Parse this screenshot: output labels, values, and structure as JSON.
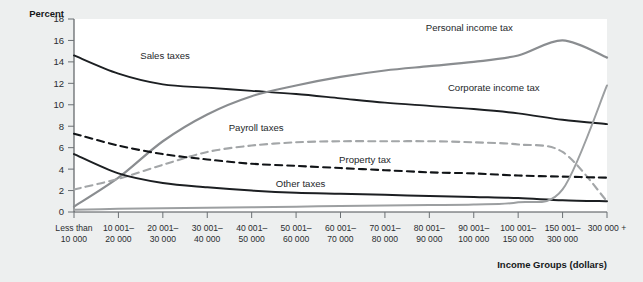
{
  "chart_data": {
    "type": "line",
    "title": "",
    "ylabel": "Percent",
    "xlabel": "Income Groups (dollars)",
    "ylim": [
      0,
      18
    ],
    "ytick_labels": [
      "0",
      "2",
      "4",
      "6",
      "8",
      "10",
      "12",
      "14",
      "16",
      "18"
    ],
    "ytick_values": [
      0,
      2,
      4,
      6,
      8,
      10,
      12,
      14,
      16,
      18
    ],
    "grid": false,
    "legend_position": "inline-annotations",
    "categories": [
      "Less than\n10 000",
      "10 001–\n20 000",
      "20 001–\n30 000",
      "30 001–\n40 000",
      "40 001–\n50 000",
      "50 001–\n60 000",
      "60 001–\n70 000",
      "70 001–\n80 000",
      "80 001–\n90 000",
      "90 001–\n100 000",
      "100 001–\n150 000",
      "150 001–\n300 000",
      "300 000 +"
    ],
    "category_lines": [
      [
        "Less than",
        "10 000"
      ],
      [
        "10 001–",
        "20 000"
      ],
      [
        "20 001–",
        "30 000"
      ],
      [
        "30 001–",
        "40 000"
      ],
      [
        "40 001–",
        "50 000"
      ],
      [
        "50 001–",
        "60 000"
      ],
      [
        "60 001–",
        "70 000"
      ],
      [
        "70 001–",
        "80 000"
      ],
      [
        "80 001–",
        "90 000"
      ],
      [
        "90 001–",
        "100 000"
      ],
      [
        "100 001–",
        "150 000"
      ],
      [
        "150 001–",
        "300 000"
      ],
      [
        "300 000 +",
        ""
      ]
    ],
    "series": [
      {
        "name": "Sales taxes",
        "color": "#1c1f22",
        "style": "solid",
        "width": 1.9,
        "label_x": 2.05,
        "label_y": 14.3,
        "values": [
          14.6,
          12.9,
          11.9,
          11.6,
          11.3,
          11.0,
          10.6,
          10.2,
          9.9,
          9.6,
          9.2,
          8.6,
          8.2
        ]
      },
      {
        "name": "Personal income tax",
        "color": "#8a8d90",
        "style": "solid",
        "width": 2.2,
        "label_x": 8.9,
        "label_y": 16.9,
        "values": [
          0.5,
          3.2,
          6.6,
          9.1,
          10.8,
          11.8,
          12.6,
          13.2,
          13.6,
          14.0,
          14.6,
          16.0,
          14.4
        ]
      },
      {
        "name": "Payroll taxes",
        "color": "#a3a6a8",
        "style": "dashed",
        "width": 2.1,
        "label_x": 4.1,
        "label_y": 7.6,
        "values": [
          2.1,
          3.1,
          4.4,
          5.6,
          6.2,
          6.5,
          6.6,
          6.6,
          6.6,
          6.5,
          6.3,
          5.6,
          1.0
        ]
      },
      {
        "name": "Property tax",
        "color": "#111417",
        "style": "dashed",
        "width": 2.1,
        "label_x": 6.55,
        "label_y": 4.6,
        "values": [
          7.3,
          6.2,
          5.4,
          4.9,
          4.5,
          4.3,
          4.1,
          3.9,
          3.7,
          3.6,
          3.4,
          3.3,
          3.2
        ]
      },
      {
        "name": "Other taxes",
        "color": "#1c1f22",
        "style": "solid",
        "width": 2.0,
        "label_x": 5.1,
        "label_y": 2.3,
        "values": [
          5.4,
          3.6,
          2.7,
          2.3,
          2.0,
          1.8,
          1.7,
          1.6,
          1.5,
          1.4,
          1.3,
          1.1,
          1.0
        ]
      },
      {
        "name": "Corporate income tax",
        "color": "#9c9fa1",
        "style": "solid",
        "width": 2.0,
        "label_x": 9.45,
        "label_y": 11.3,
        "values": [
          0.2,
          0.3,
          0.35,
          0.4,
          0.45,
          0.5,
          0.55,
          0.6,
          0.65,
          0.7,
          0.9,
          2.1,
          11.8
        ]
      }
    ]
  },
  "colors": {
    "page_background": "#edefef",
    "plot_background": "#ffffff",
    "axis": "#4c5054",
    "text": "#15181a"
  }
}
